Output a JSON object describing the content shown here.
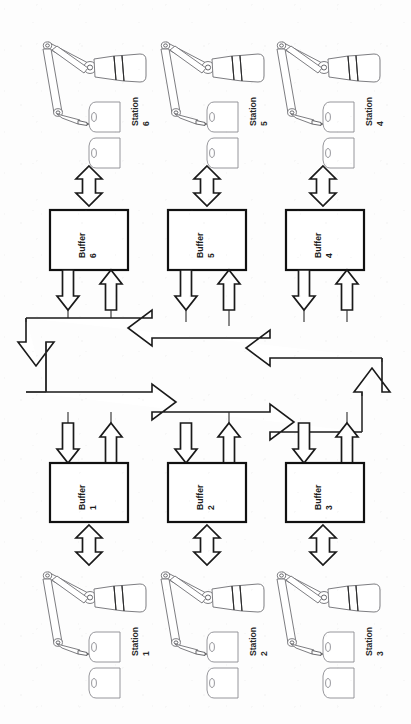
{
  "diagram": {
    "orientation": "rotated-90",
    "background_color": "#fdfdfd",
    "line_color": "#1a1a1a",
    "stations": [
      {
        "id": "station-6",
        "label_word": "Station",
        "label_number": "6",
        "row": "top",
        "column": 1
      },
      {
        "id": "station-5",
        "label_word": "Station",
        "label_number": "5",
        "row": "top",
        "column": 2
      },
      {
        "id": "station-4",
        "label_word": "Station",
        "label_number": "4",
        "row": "top",
        "column": 3
      },
      {
        "id": "station-1",
        "label_word": "Station",
        "label_number": "1",
        "row": "bottom",
        "column": 1
      },
      {
        "id": "station-2",
        "label_word": "Station",
        "label_number": "2",
        "row": "bottom",
        "column": 2
      },
      {
        "id": "station-3",
        "label_word": "Station",
        "label_number": "3",
        "row": "bottom",
        "column": 3
      }
    ],
    "buffers": [
      {
        "id": "buffer-6",
        "label_word": "Buffer",
        "label_number": "6",
        "row": "top",
        "column": 1
      },
      {
        "id": "buffer-5",
        "label_word": "Buffer",
        "label_number": "5",
        "row": "top",
        "column": 2
      },
      {
        "id": "buffer-4",
        "label_word": "Buffer",
        "label_number": "4",
        "row": "top",
        "column": 3
      },
      {
        "id": "buffer-1",
        "label_word": "Buffer",
        "label_number": "1",
        "row": "bottom",
        "column": 1
      },
      {
        "id": "buffer-2",
        "label_word": "Buffer",
        "label_number": "2",
        "row": "bottom",
        "column": 2
      },
      {
        "id": "buffer-3",
        "label_word": "Buffer",
        "label_number": "3",
        "row": "bottom",
        "column": 3
      }
    ],
    "transport_loop": {
      "name": "central-transport-loop",
      "shape": "rectangular-closed-loop",
      "flow_direction": "counter-clockwise",
      "arrowhead_count": 6
    },
    "connectors": [
      {
        "from": "station-6",
        "to": "buffer-6",
        "type": "double-headed"
      },
      {
        "from": "station-5",
        "to": "buffer-5",
        "type": "double-headed"
      },
      {
        "from": "station-4",
        "to": "buffer-4",
        "type": "double-headed"
      },
      {
        "from": "station-1",
        "to": "buffer-1",
        "type": "double-headed"
      },
      {
        "from": "station-2",
        "to": "buffer-2",
        "type": "double-headed"
      },
      {
        "from": "station-3",
        "to": "buffer-3",
        "type": "double-headed"
      },
      {
        "from": "buffer-6",
        "to": "transport-loop",
        "type": "single-out"
      },
      {
        "from": "transport-loop",
        "to": "buffer-6",
        "type": "single-in"
      },
      {
        "from": "buffer-5",
        "to": "transport-loop",
        "type": "single-out"
      },
      {
        "from": "transport-loop",
        "to": "buffer-5",
        "type": "single-in"
      },
      {
        "from": "buffer-4",
        "to": "transport-loop",
        "type": "single-out"
      },
      {
        "from": "transport-loop",
        "to": "buffer-4",
        "type": "single-in"
      },
      {
        "from": "buffer-1",
        "to": "transport-loop",
        "type": "single-out"
      },
      {
        "from": "transport-loop",
        "to": "buffer-1",
        "type": "single-in"
      },
      {
        "from": "buffer-2",
        "to": "transport-loop",
        "type": "single-out"
      },
      {
        "from": "transport-loop",
        "to": "buffer-2",
        "type": "single-in"
      },
      {
        "from": "buffer-3",
        "to": "transport-loop",
        "type": "single-out"
      },
      {
        "from": "transport-loop",
        "to": "buffer-3",
        "type": "single-in"
      }
    ],
    "icons": {
      "robot": "articulated-robot-arm-icon",
      "workpiece": "cylindrical-workpiece-icon"
    }
  }
}
